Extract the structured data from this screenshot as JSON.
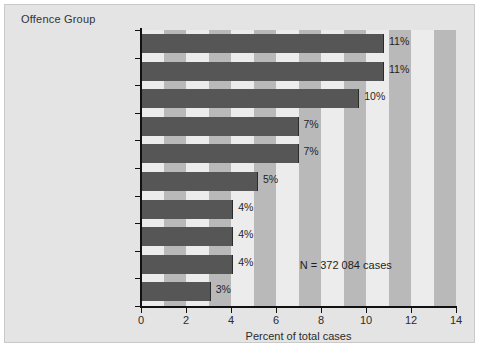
{
  "panel": {
    "title": "Offence Group"
  },
  "chart_data": {
    "type": "bar",
    "orientation": "horizontal",
    "title": "Offence Group",
    "xlabel": "Percent of total cases",
    "ylabel": "Offence Group",
    "xlim": [
      0,
      14
    ],
    "xticks": [
      "0",
      "2",
      "4",
      "6",
      "8",
      "10",
      "12",
      "14"
    ],
    "xtick_values": [
      0,
      2,
      4,
      6,
      8,
      10,
      12,
      14
    ],
    "grid": "vertical-bands",
    "legend": "none",
    "categories": [
      "Impaired driving",
      "Common assault",
      "Theft",
      "Fail to comply with order",
      "Breach of probation",
      "Major assault",
      "Uttering threats",
      "Fraud",
      "Drug possession",
      "Possess stolen property"
    ],
    "values": [
      10.8,
      10.8,
      9.7,
      7.0,
      7.0,
      5.2,
      4.1,
      4.1,
      4.1,
      3.1
    ],
    "data_labels": [
      "11%",
      "11%",
      "10%",
      "7%",
      "7%",
      "5%",
      "4%",
      "4%",
      "4%",
      "3%"
    ],
    "annotations": [
      {
        "text": "N = 372 084 cases",
        "x": 9.1,
        "y": 8.55
      }
    ],
    "colors": {
      "bar": "#565656",
      "bar_edge": "#2b2b2b",
      "band_dark": "#b9b9b9",
      "band_light": "#ececec",
      "panel_background": "#e4e4e4",
      "axis": "#111111",
      "text": "#2b2b2b"
    }
  }
}
